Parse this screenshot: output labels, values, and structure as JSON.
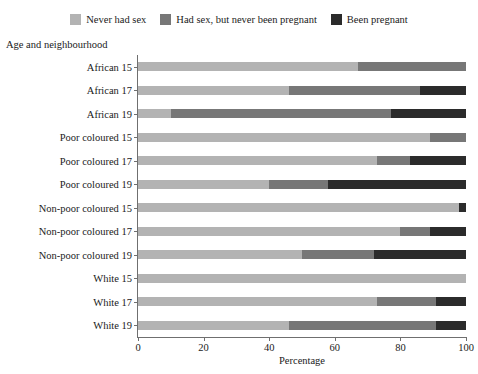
{
  "chart_data": {
    "type": "bar",
    "orientation": "horizontal",
    "stacked": true,
    "title": "",
    "xlabel": "Percentage",
    "ylabel": "Age and neighbourhood",
    "xlim": [
      0,
      100
    ],
    "xticks": [
      0,
      20,
      40,
      60,
      80,
      100
    ],
    "grid": false,
    "legend_position": "top",
    "categories": [
      "African 15",
      "African 17",
      "African 19",
      "Poor coloured 15",
      "Poor coloured 17",
      "Poor coloured 19",
      "Non-poor coloured 15",
      "Non-poor coloured 17",
      "Non-poor coloured 19",
      "White 15",
      "White 17",
      "White 19"
    ],
    "series": [
      {
        "name": "Never had sex",
        "color": "#b3b3b3",
        "values": [
          67,
          46,
          10,
          89,
          73,
          40,
          98,
          80,
          50,
          100,
          73,
          46
        ]
      },
      {
        "name": "Had sex, but never been pregnant",
        "color": "#777777",
        "values": [
          33,
          40,
          67,
          11,
          10,
          18,
          0,
          9,
          22,
          0,
          18,
          45
        ]
      },
      {
        "name": "Been pregnant",
        "color": "#2b2b2b",
        "values": [
          0,
          14,
          23,
          0,
          17,
          42,
          2,
          11,
          28,
          0,
          9,
          9
        ]
      }
    ]
  },
  "legend": {
    "items": [
      {
        "label": "Never had sex",
        "color": "#b3b3b3"
      },
      {
        "label": "Had sex, but never been pregnant",
        "color": "#777777"
      },
      {
        "label": "Been pregnant",
        "color": "#2b2b2b"
      }
    ]
  },
  "axes": {
    "y_title": "Age and neighbourhood",
    "x_title": "Percentage",
    "x_tick_labels": [
      "0",
      "20",
      "40",
      "60",
      "80",
      "100"
    ]
  }
}
